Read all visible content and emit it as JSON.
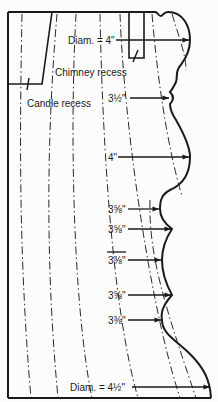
{
  "figure": {
    "colors": {
      "line": "#1a1a1a",
      "background": "#fcfcfc"
    }
  },
  "labels": {
    "top_diameter": "Diam. = 4\"",
    "chimney_recess": "Chimney recess",
    "candle_recess": "Candle recess",
    "dim_1": "3½\"",
    "dim_2": "4\"",
    "dim_3": "3⅝\"",
    "dim_4": "3⅝\"",
    "dim_5": "3⅜\"",
    "dim_6": "3⅝\"",
    "dim_7": "3⅜\"",
    "bottom_diameter": "Diam. = 4½\""
  },
  "dimensions": [
    {
      "label": "Diam. = 4\"",
      "y": 40
    },
    {
      "label": "3½\"",
      "y": 98
    },
    {
      "label": "4\"",
      "y": 157
    },
    {
      "label": "3⅝\"",
      "y": 209
    },
    {
      "label": "3⅝\"",
      "y": 229
    },
    {
      "label": "3⅜\"",
      "y": 260
    },
    {
      "label": "3⅝\"",
      "y": 295
    },
    {
      "label": "3⅜\"",
      "y": 320
    },
    {
      "label": "Diam. = 4½\"",
      "y": 387
    }
  ]
}
